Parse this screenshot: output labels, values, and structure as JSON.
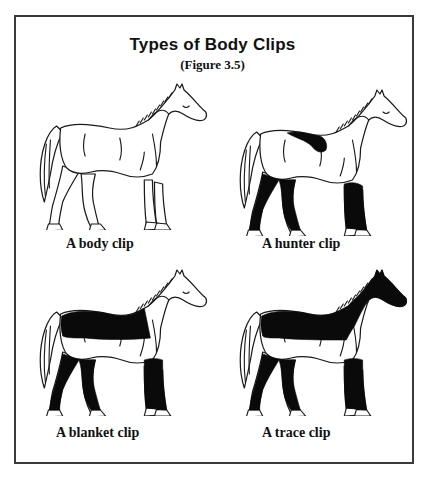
{
  "figure": {
    "title": "Types of Body Clips",
    "subtitle": "(Figure 3.5)"
  },
  "panels": [
    {
      "id": "body",
      "caption": "A body clip",
      "clipped_regions": []
    },
    {
      "id": "hunter",
      "caption": "A hunter clip",
      "clipped_regions": [
        "saddle-patch",
        "legs"
      ]
    },
    {
      "id": "blanket",
      "caption": "A blanket clip",
      "clipped_regions": [
        "back-blanket",
        "legs"
      ]
    },
    {
      "id": "trace",
      "caption": "A trace clip",
      "clipped_regions": [
        "upper-body",
        "neck",
        "head",
        "legs"
      ]
    }
  ],
  "colors": {
    "ink": "#1a1a1a",
    "unclipped_coat": "#0a0a0a",
    "background": "#ffffff",
    "frame": "#3a3a3a"
  }
}
